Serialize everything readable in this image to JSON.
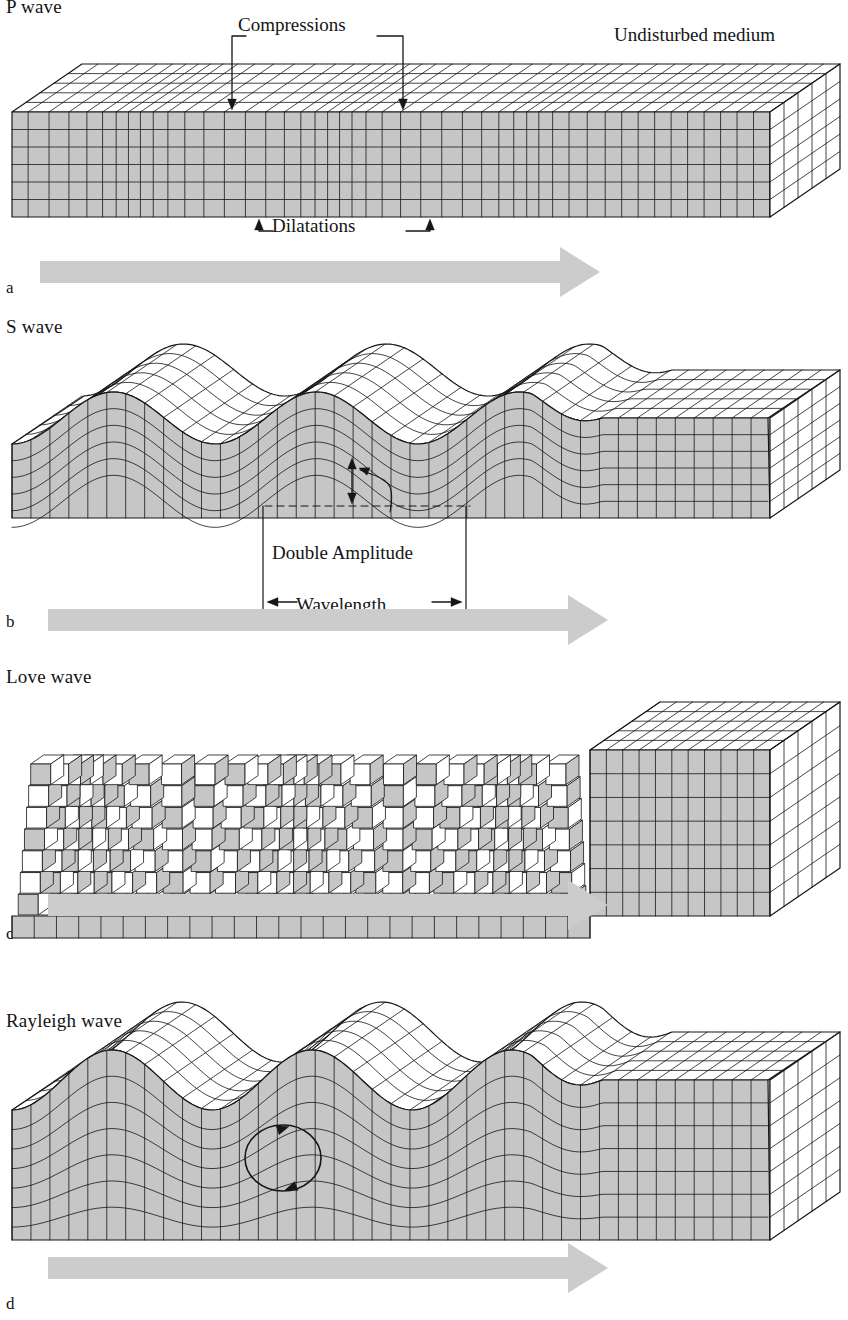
{
  "figure": {
    "background": "#ffffff",
    "line_color": "#161616",
    "shade_color": "#c6c6c6",
    "top_face_color": "#ffffff",
    "arrow_gray": "#cccccc"
  },
  "panels": [
    {
      "id": "p-wave",
      "letter": "a",
      "title": "P wave",
      "wave_kind": "compressional",
      "annotations": [
        {
          "name": "compressions",
          "label": "Compressions",
          "direction": "down",
          "x_span": [
            232,
            403
          ]
        },
        {
          "name": "dilatations",
          "label": "Dilatations",
          "direction": "up",
          "x_span": [
            259,
            430
          ]
        },
        {
          "name": "undisturbed-medium",
          "label": "Undisturbed medium",
          "direction": "none",
          "x_span": [
            614,
            836
          ]
        }
      ],
      "propagation_arrow": {
        "label": "propagation direction",
        "x": 40,
        "y": 264,
        "length": 560
      }
    },
    {
      "id": "s-wave",
      "letter": "b",
      "title": "S wave",
      "wave_kind": "shear-vertical",
      "annotations": [
        {
          "name": "double-amplitude",
          "label": "Double Amplitude",
          "direction": "vertical-double",
          "x_span": [
            265,
            470
          ]
        },
        {
          "name": "wavelength",
          "label": "Wavelength",
          "direction": "horizontal-double",
          "x_span": [
            263,
            466
          ]
        }
      ],
      "propagation_arrow": {
        "label": "propagation direction",
        "x": 48,
        "y": 616,
        "length": 560
      }
    },
    {
      "id": "love-wave",
      "letter": "c",
      "title": "Love wave",
      "wave_kind": "shear-horizontal-surface",
      "annotations": [],
      "propagation_arrow": {
        "label": "propagation direction",
        "x": 48,
        "y": 905,
        "length": 560
      }
    },
    {
      "id": "rayleigh-wave",
      "letter": "d",
      "title": "Rayleigh wave",
      "wave_kind": "retrograde-elliptical-surface",
      "annotations": [
        {
          "name": "particle-motion-ellipse",
          "label": "retrograde particle motion",
          "direction": "circular",
          "x_span": [
            235,
            330
          ]
        }
      ],
      "propagation_arrow": {
        "label": "propagation direction",
        "x": 48,
        "y": 1268,
        "length": 560
      }
    }
  ],
  "chart_data": {
    "type": "diagram",
    "series": [
      {
        "name": "P wave",
        "wavelength_px": 203,
        "amplitude_px": 0,
        "surface": false,
        "note": "alternating compressions and dilatations; no surface warping"
      },
      {
        "name": "S wave",
        "wavelength_px": 203,
        "amplitude_px": 26,
        "surface": false,
        "note": "transverse vertical shear; double amplitude marked"
      },
      {
        "name": "Love wave",
        "wavelength_px": 210,
        "amplitude_px": 34,
        "surface": true,
        "note": "horizontal shear confined near the surface"
      },
      {
        "name": "Rayleigh wave",
        "wavelength_px": 200,
        "amplitude_px": 30,
        "surface": true,
        "note": "retrograde elliptical particle motion decaying with depth"
      }
    ],
    "undisturbed_zone_start_px": 600,
    "legend_position": "none",
    "grid": true
  }
}
